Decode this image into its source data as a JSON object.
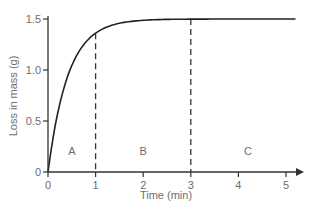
{
  "chart_data": {
    "type": "line",
    "title": "",
    "xlabel": "Time (min)",
    "ylabel": "Loss in mass (g)",
    "xlim": [
      0,
      5.3
    ],
    "ylim": [
      0,
      1.5
    ],
    "x_ticks": [
      "0",
      "1",
      "2",
      "3",
      "4",
      "5"
    ],
    "y_ticks": [
      "0",
      "0.5",
      "1.0",
      "1.5"
    ],
    "grid": false,
    "series": [
      {
        "name": "Loss in mass",
        "x": [
          0,
          0.1,
          0.2,
          0.3,
          0.4,
          0.5,
          0.6,
          0.8,
          1.0,
          1.25,
          1.5,
          2.0,
          2.5,
          3.0,
          4.0,
          5.0,
          5.2
        ],
        "y": [
          0,
          0.36,
          0.63,
          0.83,
          0.98,
          1.09,
          1.18,
          1.3,
          1.37,
          1.42,
          1.45,
          1.48,
          1.49,
          1.5,
          1.5,
          1.5,
          1.5
        ]
      }
    ],
    "annotations": [
      {
        "type": "vline",
        "x": 1,
        "style": "dashed"
      },
      {
        "type": "vline",
        "x": 3,
        "style": "dashed"
      },
      {
        "type": "label",
        "text": "A",
        "x": 0.5,
        "y": 0.15
      },
      {
        "type": "label",
        "text": "B",
        "x": 2.0,
        "y": 0.15
      },
      {
        "type": "label",
        "text": "C",
        "x": 4.2,
        "y": 0.15
      }
    ]
  },
  "axis": {
    "xlabel": "Time (min)",
    "ylabel": "Loss in mass (g)",
    "x_ticks": [
      "0",
      "1",
      "2",
      "3",
      "4",
      "5"
    ],
    "y_ticks": [
      "0",
      "0.5",
      "1.0",
      "1.5"
    ]
  },
  "regions": [
    "A",
    "B",
    "C"
  ],
  "colors": {
    "line": "#222222",
    "axis": "#333333",
    "text": "#6d6d6d"
  }
}
